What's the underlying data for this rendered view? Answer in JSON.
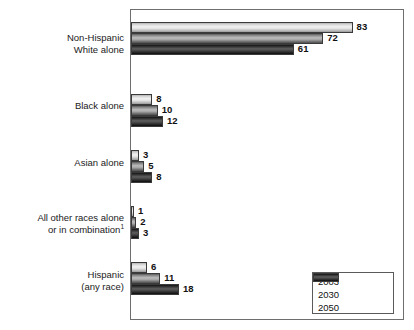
{
  "chart_data": {
    "type": "bar",
    "orientation": "horizontal",
    "title": "",
    "xlabel": "",
    "ylabel": "",
    "grid": false,
    "legend_position": "bottom-right",
    "xlim": [
      0,
      100
    ],
    "categories": [
      "Non-Hispanic White alone",
      "Black alone",
      "Asian alone",
      "All other races alone or in combination",
      "Hispanic (any race)"
    ],
    "series": [
      {
        "name": "2003",
        "values": [
          83,
          8,
          3,
          1,
          6
        ]
      },
      {
        "name": "2030",
        "values": [
          72,
          10,
          5,
          2,
          11
        ]
      },
      {
        "name": "2050",
        "values": [
          61,
          12,
          8,
          3,
          18
        ]
      }
    ]
  },
  "groups": [
    {
      "label_line1": "Non-Hispanic",
      "label_line2": "White alone",
      "footnote_marker": "",
      "bars": [
        {
          "series": "2003",
          "value": 83,
          "value_text": "83"
        },
        {
          "series": "2030",
          "value": 72,
          "value_text": "72"
        },
        {
          "series": "2050",
          "value": 61,
          "value_text": "61"
        }
      ]
    },
    {
      "label_line1": "Black alone",
      "label_line2": "",
      "footnote_marker": "",
      "bars": [
        {
          "series": "2003",
          "value": 8,
          "value_text": "8"
        },
        {
          "series": "2030",
          "value": 10,
          "value_text": "10"
        },
        {
          "series": "2050",
          "value": 12,
          "value_text": "12"
        }
      ]
    },
    {
      "label_line1": "Asian alone",
      "label_line2": "",
      "footnote_marker": "",
      "bars": [
        {
          "series": "2003",
          "value": 3,
          "value_text": "3"
        },
        {
          "series": "2030",
          "value": 5,
          "value_text": "5"
        },
        {
          "series": "2050",
          "value": 8,
          "value_text": "8"
        }
      ]
    },
    {
      "label_line1": "All other races alone",
      "label_line2": "or in combination",
      "footnote_marker": "1",
      "bars": [
        {
          "series": "2003",
          "value": 1,
          "value_text": "1"
        },
        {
          "series": "2030",
          "value": 2,
          "value_text": "2"
        },
        {
          "series": "2050",
          "value": 3,
          "value_text": "3"
        }
      ]
    },
    {
      "label_line1": "Hispanic",
      "label_line2": "(any race)",
      "footnote_marker": "",
      "bars": [
        {
          "series": "2003",
          "value": 6,
          "value_text": "6"
        },
        {
          "series": "2030",
          "value": 11,
          "value_text": "11"
        },
        {
          "series": "2050",
          "value": 18,
          "value_text": "18"
        }
      ]
    }
  ],
  "legend": {
    "entries": [
      {
        "label": "2003"
      },
      {
        "label": "2030"
      },
      {
        "label": "2050"
      }
    ]
  },
  "colors": {
    "series_2003": "#e2e2e2",
    "series_2030": "#a6a6a6",
    "series_2050": "#3a3a3a",
    "frame": "#6e6e6e",
    "text": "#111111"
  }
}
